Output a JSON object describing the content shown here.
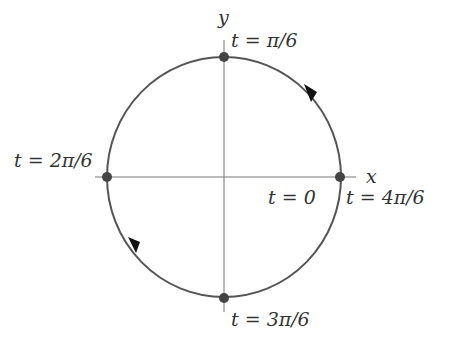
{
  "diagram": {
    "type": "parametric-circle",
    "center": [
      224,
      177
    ],
    "rx": 117,
    "ry": 120,
    "axes": {
      "x_label": "x",
      "y_label": "y"
    },
    "points": [
      {
        "name": "right",
        "label": "t = 0",
        "label2": "t = 4π/6"
      },
      {
        "name": "top",
        "label": "t = π/6"
      },
      {
        "name": "left",
        "label": "t = 2π/6"
      },
      {
        "name": "bottom",
        "label": "t = 3π/6"
      }
    ],
    "direction": "counterclockwise",
    "colors": {
      "curve": "#555555",
      "axis": "#777777",
      "dot": "#444444",
      "arrow": "#111111"
    }
  }
}
